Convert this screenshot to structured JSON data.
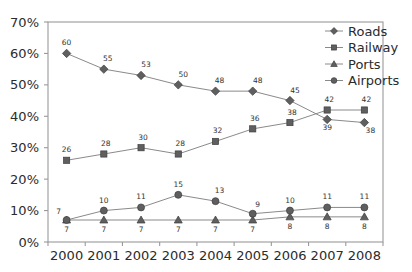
{
  "chart_data": {
    "type": "line",
    "title": "",
    "xlabel": "",
    "ylabel": "",
    "categories": [
      "2000",
      "2001",
      "2002",
      "2003",
      "2004",
      "2005",
      "2006",
      "2007",
      "2008"
    ],
    "ylim": [
      0,
      70
    ],
    "ytick_labels": [
      "0%",
      "10%",
      "20%",
      "30%",
      "40%",
      "50%",
      "60%",
      "70%"
    ],
    "ytick_values": [
      0,
      10,
      20,
      30,
      40,
      50,
      60,
      70
    ],
    "grid": false,
    "legend_position": "top-right-inside",
    "series": [
      {
        "name": "Roads",
        "marker": "diamond",
        "color": "#5f5f5f",
        "values": [
          60,
          55,
          53,
          50,
          48,
          48,
          45,
          39,
          38
        ],
        "labels": [
          "60",
          "55",
          "53",
          "50",
          "48",
          "48",
          "45",
          "39",
          "38"
        ]
      },
      {
        "name": "Railway",
        "marker": "square",
        "color": "#5f5f5f",
        "values": [
          26,
          28,
          30,
          28,
          32,
          36,
          38,
          42,
          42
        ],
        "labels": [
          "26",
          "28",
          "30",
          "28",
          "32",
          "36",
          "38",
          "42",
          "42"
        ]
      },
      {
        "name": "Ports",
        "marker": "triangle",
        "color": "#5f5f5f",
        "values": [
          7,
          7,
          7,
          7,
          7,
          7,
          8,
          8,
          8
        ],
        "labels": [
          "7",
          "7",
          "7",
          "7",
          "7",
          "7",
          "8",
          "8",
          "8"
        ]
      },
      {
        "name": "Airports",
        "marker": "circle",
        "color": "#5f5f5f",
        "values": [
          7,
          10,
          11,
          15,
          13,
          9,
          10,
          11,
          11
        ],
        "labels": [
          "7",
          "10",
          "11",
          "15",
          "13",
          "9",
          "10",
          "11",
          "11"
        ]
      }
    ]
  },
  "legend": {
    "items": [
      {
        "label": "Roads",
        "marker": "diamond"
      },
      {
        "label": "Railway",
        "marker": "square"
      },
      {
        "label": "Ports",
        "marker": "triangle"
      },
      {
        "label": "Airports",
        "marker": "circle"
      }
    ]
  }
}
